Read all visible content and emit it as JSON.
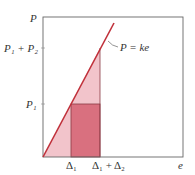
{
  "diagram": {
    "y_axis_label": "P",
    "x_axis_label": "e",
    "line_label": "P = ke",
    "y_ticks": [
      {
        "label": "P₁ + P₂"
      },
      {
        "label": "P₁"
      }
    ],
    "x_ticks": [
      {
        "label": "Δ₁"
      },
      {
        "label": "Δ₁ + Δ₂"
      }
    ],
    "colors": {
      "line": "#c0303a",
      "light_fill": "#f2c4cb",
      "dark_fill": "#d9707f",
      "frame": "#666666"
    }
  }
}
